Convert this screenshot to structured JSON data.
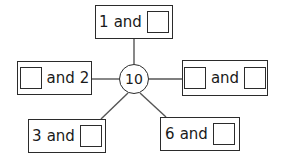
{
  "diagram": {
    "type": "number-bond-web",
    "center": {
      "value": "10"
    },
    "connector_color": "#555555",
    "border_color": "#2b2b2b",
    "background_color": "#ffffff",
    "nodes": [
      {
        "id": "top",
        "position": "top",
        "left_term": "1",
        "operator": "and",
        "right_term": "",
        "left_is_blank": false,
        "right_is_blank": true,
        "box": {
          "x": 95,
          "y": 5,
          "w": 78,
          "h": 34
        }
      },
      {
        "id": "left",
        "position": "left",
        "left_term": "",
        "operator": "and",
        "right_term": "2",
        "left_is_blank": true,
        "right_is_blank": false,
        "box": {
          "x": 17,
          "y": 61,
          "w": 75,
          "h": 34
        }
      },
      {
        "id": "right",
        "position": "right",
        "left_term": "",
        "operator": "and",
        "right_term": "",
        "left_is_blank": true,
        "right_is_blank": true,
        "box": {
          "x": 182,
          "y": 60,
          "w": 86,
          "h": 36
        }
      },
      {
        "id": "bottom-left",
        "position": "bottom-left",
        "left_term": "3",
        "operator": "and",
        "right_term": "",
        "left_is_blank": false,
        "right_is_blank": true,
        "box": {
          "x": 28,
          "y": 119,
          "w": 78,
          "h": 34
        }
      },
      {
        "id": "bottom-right",
        "position": "bottom-right",
        "left_term": "6",
        "operator": "and",
        "right_term": "",
        "left_is_blank": false,
        "right_is_blank": true,
        "box": {
          "x": 160,
          "y": 117,
          "w": 80,
          "h": 34
        }
      }
    ]
  }
}
